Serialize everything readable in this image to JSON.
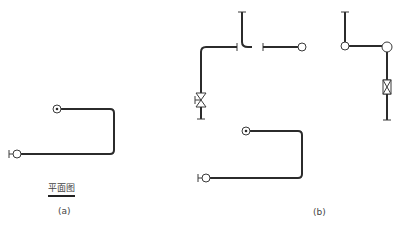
{
  "figure": {
    "top_cutoff_text": "···",
    "panel_a": {
      "caption": "(a)",
      "view_label": "平面图"
    },
    "panel_b": {
      "caption": "(b)"
    },
    "colors": {
      "pipe": "#2b2b2b",
      "background": "#ffffff",
      "text": "#444444"
    },
    "symbols": {
      "riser_up": "circle-with-dot",
      "riser_down": "circle",
      "pipe_end_cap": "tick",
      "valve": "bowtie-valve"
    }
  }
}
